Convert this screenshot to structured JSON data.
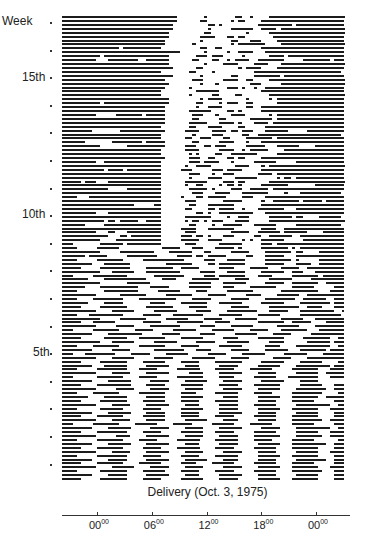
{
  "chart_data": {
    "type": "raster",
    "title": "",
    "xlabel": "Delivery (Oct. 3, 1975)",
    "ylabel": "Week",
    "y_tick_labels": [
      {
        "label": "Week",
        "week": 17
      },
      {
        "label": "15th",
        "week": 15
      },
      {
        "label": "10th",
        "week": 10
      },
      {
        "label": "5th",
        "week": 5
      }
    ],
    "y_week_ticks": 17,
    "days_per_week": 7,
    "x_ticks": [
      {
        "hour": "00",
        "min": "00",
        "offset_h": 0
      },
      {
        "hour": "06",
        "min": "00",
        "offset_h": 6
      },
      {
        "hour": "12",
        "min": "00",
        "offset_h": 12
      },
      {
        "hour": "18",
        "min": "00",
        "offset_h": 18
      },
      {
        "hour": "00",
        "min": "00",
        "offset_h": 24
      }
    ],
    "x_range_hours": [
      -3.8,
      27.2
    ],
    "bin_hours": 0.5,
    "row_encoding": "each string = one day from top (latest) to bottom (earliest); '#' = sleep bin, '.' = awake bin; 62 bins of 0.5h starting at -3.8h",
    "rows": [
      "##############################.......#.......##..#....#####################",
      "##############################......##......#.##....#######################",
      "#############################.........##.#.........#########.##############",
      "#############################.........#.....######..####.#################",
      "############################.........##.........#.....####################",
      "############################........####...##.##.......###################",
      "###########################.........#.......##...###....##################",
      "###########################.......#.........#.#######....#################",
      "###############.##########..........##..##..........######################",
      "###############################......#.....#..####...#####################",
      "##########.#################.......###.###.....#......####.###############",
      "#########...########..######......##...##..#.####..#######.....#######.###",
      "############################.........#....####....####...#################",
      "#############################......##.........#.####....##################",
      "##########################.......##....#..........#######################.",
      "#############################.......#.......##....#######.################",
      "###########################.......###.....####..##....####################",
      "############################........#...#........###.....#################",
      "###########################......#.........###.#..#..#####################",
      "##########################.........######...........######################",
      "##########################.......#.....##....##.......####################",
      "############################........#.####......#.....#.##################",
      "##########.#################.......##....#.###..##......##################",
      "###########################........#..####......##..######################",
      "###########################......######....##.#.....######################",
      "#########.....#######.#####.......###...#...####......#.##################",
      "###########################.......##.....##......######.##################",
      "###########################......#####...####.#...####.###################",
      "##########################.......##...####....##.....#####################",
      "########.......############.....####...####.##.###...######.....##########",
      "##########################........#....###.....##..######################",
      "##########################......##..###...##....#######.##################",
      "######.......########.#####.......##.....####...#...######################",
      "##########.......##########.....###..##.###.....#####...######....########",
      "##########################......####.....####..#.#####....################",
      "##########################.......#.#....##..#######.....##################",
      "###########################......###..##...##.##....######################",
      "#########..###############.......###.####...#.....######.....#############",
      "##########################......#..####......####...#.####################",
      "###########.####.#########.....###.....###.####.....######################",
      "##########################.......###...#..###......####.##################",
      "##########################.......#....####...######.....#.##.#############",
      "#####.###...##############......######....###.##......####################",
      "##########################......#..##....#.##.#.....#######.......########",
      "############.....#########.......#####.#....###..#####.###################",
      "##########################........###...####...#######....#...###########",
      "####...###################.....#...##.#####....###...#####################",
      "##########################......###.......#####.....#..#######.#####.#####",
      "###################.....##.......##...#######.......######################",
      "##########################......##....##.####..#...#######...#############",
      "#########...##############.........##.#..#########...#####################",
      "##########################......#######....#..###.....######.##....######",
      "###########.##.#####..####......#.##.#.###...####.....####################",
      "######.....###############.......##....#..#####...######.....############",
      "##########################.....####...#######.......####..################",
      "#########...##...#########......###.........#####..######.######....######",
      "############...##.########.....###.##.#...###.....##..######..############",
      "##########....############.....#####..####.....#.#..######.....###########",
      "###.......######.#########......###......######.....###.##################",
      "####.....######...........#####...###...#####.#.....#######.#.############",
      "##########.....#########....######...##.....#####....#######.##....#######",
      "######.#####.....########.....####.##.#####.....##...#####...#############",
      "####.....#######.....###########.....###...#####.....#######.#.....#######",
      "########...#######.........#######....##.#######.....#####...####..#######",
      "#####.....########....#######..#####.....####....#####...#####..##########",
      "##########...######...#########.....####...#####....######..###...########",
      "###.....#########.......########.....###.#######...####.....#######.######",
      "#######....###########....####....#######....####.....######.....#########",
      "##########.......######..........######...######.....#####..#######..#####",
      "######....##########...#####.....######...###....#######....######.....###",
      "####.......#########.....######....###.....#######.......##########...####",
      "#########......#######.....#######....#####.....####....######..##########",
      "####....########....##########....#####.....#####....########..######..###",
      "#######....#####.......####....#######...######.....######....########.###",
      "#####.....#######.....#######....#####......#####.....########..####...###",
      "#########....######.....######.....####....########...#####...#########..#",
      "####...#########.....#####...########....######....######.....###########.",
      "##########.....#######.....######....#####...######......######...########",
      "#####...######.......#####....#######...####.......#######..#####....#####",
      "#########.....#####....########.....####....######......######....########",
      "###.....#######....#####.....######....######....#####...#######...#######",
      "########....#########.....#####.....####.....######....#####.....#########",
      "#####......######...#######....######.....####.....#######.....#######..##",
      "##########...######.....######.....#####...######.....####......######.###",
      "####....#######.....#######....#####.....######......####....#########..##",
      "########.....#####......########...####.....#####....######...#######.####",
      "###...########....#####....######.....#####....######.....######....######",
      "#########....######.....#####.....######....#####......#####....##########",
      "#####.....#######....######....#####....#######.....######....######....##",
      "########...######.....######....####.....#####.....######....#########.###",
      "####.....########...#####.....######....#####....######.....#######...####",
      "#########....#####....######.....####....######....#####.....######..#####",
      "###......#######....#####.....#######....####.....######...########...####",
      "########....######.....#####....######....#####.....######....#####.......#",
      "#####....#########....#####....######....#####....#######.....######...###",
      "#########.....#####....#####....#####.....#####....######....########..###",
      "####....#######.....#######....####.....######....#####.....########....##",
      "#######....######.....#####....######.....####.....######...#######..#####",
      "#####.....#######....######....#####....######.....#####....######.....###",
      "#########....#####....######....####.....#####....######.....#########..##",
      "####......######.....#####.....######....#####.....######...#######...####",
      "########....######....#####....#####.....######....#####.....######....###",
      "#####....#######.....######....#####....#####.....######....#######....###",
      "#########....#####....#####.....######....####.....#####....########..####",
      "###.....#######....######....#####.....######....######.....######.....###",
      "########....######.....#####....#####....######.....#####....#########..##",
      "#####....########....#####.....######...#####.....######.....######...####",
      "#########.....####....######....#####....#####....#######....#######..####",
      "####.....#######....#####.....######....######....#####.....######......##",
      "########....######....######....####.....#####.....######...#########..###",
      "#####....#######.....#####....######....#####.....######....#######....###",
      "#########....#####....######....#####.....#####....#####.....######...####",
      "####.....########....#####.....#####....######.....######...#######....###",
      "########....#####.....######....######....####.....#####.....########..###",
      "#####....#######....######.....####....######.....######....######.....###",
      "#########....######....#####....#####.....#####....######...#######...####",
      "####......#######....######....#####....#####.....######....########...###",
      "########....#####.....######....####.....######....#####.....######....###",
      "#####.....#######....#####.....######....#####.....######...#######....###"
    ]
  }
}
